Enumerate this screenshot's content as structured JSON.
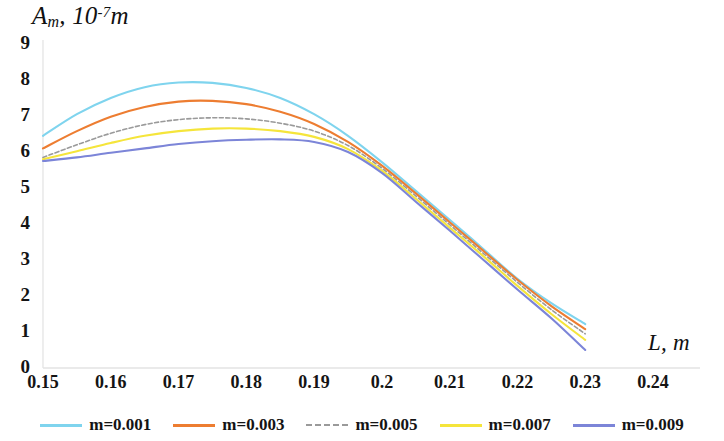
{
  "chart_data": {
    "type": "line",
    "title": "",
    "ylabel": "A_m, 10^-7 m",
    "ylabel_parts": {
      "main": "A",
      "sub": "m",
      "comma": ", 10",
      "sup": "-7",
      "tail": "m"
    },
    "xlabel": "L, m",
    "xlim": [
      0.15,
      0.24
    ],
    "ylim": [
      0,
      9
    ],
    "xticks": [
      "0.15",
      "0.16",
      "0.17",
      "0.18",
      "0.19",
      "0.2",
      "0.21",
      "0.22",
      "0.23",
      "0.24"
    ],
    "yticks": [
      "0",
      "1",
      "2",
      "3",
      "4",
      "5",
      "6",
      "7",
      "8",
      "9"
    ],
    "grid": false,
    "legend_position": "bottom",
    "x": [
      0.15,
      0.155,
      0.16,
      0.165,
      0.17,
      0.175,
      0.18,
      0.185,
      0.19,
      0.195,
      0.2,
      0.205,
      0.21,
      0.215,
      0.22,
      0.225,
      0.23
    ],
    "series": [
      {
        "name": "m=0.001",
        "color": "#7FD4EE",
        "dash": false,
        "values": [
          6.45,
          7.05,
          7.5,
          7.8,
          7.93,
          7.92,
          7.78,
          7.5,
          7.05,
          6.45,
          5.72,
          4.92,
          4.12,
          3.3,
          2.48,
          1.8,
          1.22
        ]
      },
      {
        "name": "m=0.003",
        "color": "#ED7D31",
        "dash": false,
        "values": [
          6.1,
          6.58,
          6.98,
          7.25,
          7.4,
          7.42,
          7.33,
          7.12,
          6.78,
          6.28,
          5.62,
          4.85,
          4.05,
          3.25,
          2.45,
          1.72,
          1.08
        ]
      },
      {
        "name": "m=0.005",
        "color": "#9A9A9A",
        "dash": true,
        "values": [
          5.85,
          6.2,
          6.52,
          6.76,
          6.9,
          6.95,
          6.92,
          6.8,
          6.58,
          6.18,
          5.55,
          4.78,
          3.98,
          3.18,
          2.38,
          1.62,
          0.95
        ]
      },
      {
        "name": "m=0.007",
        "color": "#F5E53B",
        "dash": false,
        "values": [
          5.8,
          6.02,
          6.25,
          6.45,
          6.58,
          6.65,
          6.65,
          6.58,
          6.42,
          6.08,
          5.48,
          4.7,
          3.9,
          3.1,
          2.28,
          1.5,
          0.78
        ]
      },
      {
        "name": "m=0.009",
        "color": "#7C85D8",
        "dash": false,
        "values": [
          5.75,
          5.85,
          5.98,
          6.1,
          6.22,
          6.3,
          6.34,
          6.35,
          6.28,
          6.0,
          5.42,
          4.62,
          3.82,
          3.0,
          2.18,
          1.38,
          0.5
        ]
      }
    ]
  },
  "legend": {
    "items": [
      {
        "label": "m=0.001",
        "color": "#7FD4EE",
        "dash": false
      },
      {
        "label": "m=0.003",
        "color": "#ED7D31",
        "dash": false
      },
      {
        "label": "m=0.005",
        "color": "#9A9A9A",
        "dash": true
      },
      {
        "label": "m=0.007",
        "color": "#F5E53B",
        "dash": false
      },
      {
        "label": "m=0.009",
        "color": "#7C85D8",
        "dash": false
      }
    ]
  },
  "axes": {
    "x_axis_color": "#d6d6d6",
    "y_axis_color": "#d6d6d6"
  }
}
